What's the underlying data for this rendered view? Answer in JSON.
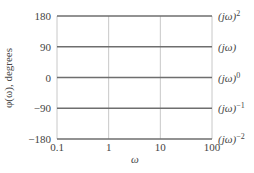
{
  "chart_data": {
    "type": "line",
    "title": "",
    "xlabel": "ω",
    "ylabel": "φ(ω), degrees",
    "xscale": "log",
    "xlim": [
      0.1,
      100
    ],
    "ylim": [
      -180,
      180
    ],
    "x_ticks": [
      "0.1",
      "1",
      "10",
      "100"
    ],
    "y_ticks": [
      "180",
      "90",
      "0",
      "−90",
      "−180"
    ],
    "grid": true,
    "series": [
      {
        "name": "(jω)^2",
        "label_base": "(jω)",
        "label_sup": "2",
        "x": [
          0.1,
          100
        ],
        "values": [
          180,
          180
        ]
      },
      {
        "name": "(jω)",
        "label_base": "(jω)",
        "label_sup": "",
        "x": [
          0.1,
          100
        ],
        "values": [
          90,
          90
        ]
      },
      {
        "name": "(jω)^0",
        "label_base": "(jω)",
        "label_sup": "0",
        "x": [
          0.1,
          100
        ],
        "values": [
          0,
          0
        ]
      },
      {
        "name": "(jω)^-1",
        "label_base": "(jω)",
        "label_sup": "−1",
        "x": [
          0.1,
          100
        ],
        "values": [
          -90,
          -90
        ]
      },
      {
        "name": "(jω)^-2",
        "label_base": "(jω)",
        "label_sup": "−2",
        "x": [
          0.1,
          100
        ],
        "values": [
          -180,
          -180
        ]
      }
    ],
    "legend_position": "right-inline"
  }
}
